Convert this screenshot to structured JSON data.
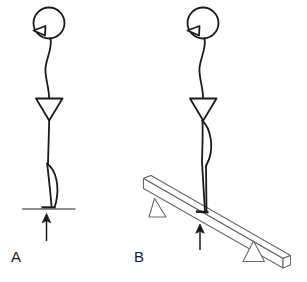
{
  "figure": {
    "background_color": "#ffffff",
    "stroke_color": "#1b1b1b",
    "beam_stroke_color": "#6b6b6b",
    "panels": [
      {
        "id": "A",
        "label": "A",
        "caption": "Stick figure standing upright on flat rigid ground with upward reaction force arrow",
        "surface": "flat-ground-line",
        "force_arrow": "upward"
      },
      {
        "id": "B",
        "label": "B",
        "caption": "Stick figure standing on a tilted beam supported by two triangular supports with upward reaction force arrow",
        "surface": "tilted-beam",
        "force_arrow": "upward",
        "supports": 2
      }
    ],
    "elements": {
      "head": "circle",
      "nose": "triangle",
      "spine": "s-curve-line",
      "torso": "inverted-triangle",
      "leg": "curved-calf-line",
      "foot": "short-horizontal-line",
      "ground": "horizontal-line",
      "arrow": "up-arrow",
      "support": "triangle",
      "beam": "3d-rectangular-prism"
    }
  }
}
